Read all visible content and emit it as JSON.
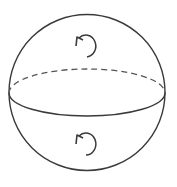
{
  "diagram": {
    "title": "",
    "colors": {
      "background": "#ffffff",
      "stroke": "#3a3a3a"
    },
    "sphere": {
      "cx": 87,
      "cy": 92,
      "r": 78
    },
    "equator": {
      "cx": 87,
      "cy": 93,
      "rx": 78,
      "ry": 24,
      "back_half_style": "dashed",
      "front_half_style": "solid"
    },
    "arrows": [
      {
        "id": "upper-hemisphere-rotation",
        "cx": 86,
        "cy": 46,
        "r": 10,
        "icon": "rotation-arrow-icon"
      },
      {
        "id": "lower-hemisphere-rotation",
        "cx": 85,
        "cy": 143,
        "r": 10,
        "icon": "rotation-arrow-icon"
      }
    ]
  }
}
